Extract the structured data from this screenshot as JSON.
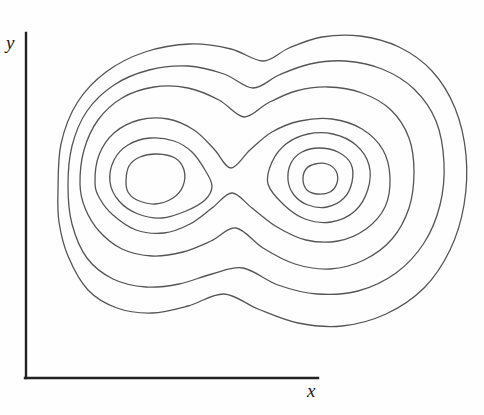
{
  "figure": {
    "kind": "contour-plot",
    "background_color": "#fefefe",
    "width": 484,
    "height": 415
  },
  "axes": {
    "x_label": "x",
    "y_label": "y",
    "axis_color": "#222222",
    "origin": {
      "x": 26,
      "y": 378
    },
    "x_axis_end": {
      "x": 318,
      "y": 378
    },
    "y_axis_end": {
      "x": 26,
      "y": 33
    },
    "ticks": [],
    "tick_labels": []
  },
  "chart_data": {
    "type": "line",
    "title": "",
    "subtitle": "",
    "xlabel": "x",
    "ylabel": "y",
    "grid": false,
    "legend": null,
    "legend_position": "none",
    "xlim": [
      0,
      484
    ],
    "ylim": [
      0,
      415
    ],
    "line_color": "#555555",
    "line_width": 1.3,
    "fill": "none",
    "maxima": [
      {
        "name": "left-peak",
        "x": 155,
        "y": 181
      },
      {
        "name": "right-peak",
        "x": 320,
        "y": 180
      }
    ],
    "saddle": {
      "name": "saddle-point",
      "x": 231,
      "y": 193
    },
    "contour_count": 9,
    "series": [
      {
        "name": "contour-level-1-left-inner",
        "closed": true,
        "level": 9,
        "points": [
          [
            126,
            181
          ],
          [
            129,
            166
          ],
          [
            140,
            157
          ],
          [
            157,
            154
          ],
          [
            175,
            158
          ],
          [
            184,
            170
          ],
          [
            183,
            186
          ],
          [
            173,
            198
          ],
          [
            155,
            204
          ],
          [
            137,
            200
          ],
          [
            128,
            192
          ]
        ]
      },
      {
        "name": "contour-level-1-right-inner",
        "closed": true,
        "level": 9,
        "points": [
          [
            303,
            180
          ],
          [
            306,
            169
          ],
          [
            315,
            164
          ],
          [
            327,
            164
          ],
          [
            336,
            171
          ],
          [
            337,
            183
          ],
          [
            330,
            192
          ],
          [
            317,
            194
          ],
          [
            307,
            190
          ]
        ]
      },
      {
        "name": "contour-level-2-right",
        "closed": true,
        "level": 8,
        "points": [
          [
            288,
            180
          ],
          [
            291,
            163
          ],
          [
            302,
            152
          ],
          [
            319,
            148
          ],
          [
            338,
            152
          ],
          [
            351,
            164
          ],
          [
            352,
            182
          ],
          [
            344,
            198
          ],
          [
            327,
            207
          ],
          [
            308,
            205
          ],
          [
            294,
            195
          ]
        ]
      },
      {
        "name": "contour-level-3-left",
        "closed": true,
        "level": 7,
        "points": [
          [
            110,
            182
          ],
          [
            114,
            160
          ],
          [
            128,
            145
          ],
          [
            150,
            138
          ],
          [
            174,
            141
          ],
          [
            192,
            152
          ],
          [
            205,
            170
          ],
          [
            212,
            186
          ],
          [
            205,
            200
          ],
          [
            186,
            211
          ],
          [
            162,
            218
          ],
          [
            138,
            214
          ],
          [
            119,
            201
          ]
        ]
      },
      {
        "name": "contour-level-3-right",
        "closed": true,
        "level": 7,
        "points": [
          [
            268,
            184
          ],
          [
            272,
            162
          ],
          [
            286,
            144
          ],
          [
            308,
            134
          ],
          [
            333,
            134
          ],
          [
            356,
            145
          ],
          [
            369,
            165
          ],
          [
            368,
            189
          ],
          [
            355,
            211
          ],
          [
            331,
            222
          ],
          [
            305,
            219
          ],
          [
            284,
            205
          ]
        ]
      },
      {
        "name": "contour-level-4-figure-eight",
        "closed": true,
        "level": 6,
        "points": [
          [
            95,
            183
          ],
          [
            99,
            155
          ],
          [
            114,
            133
          ],
          [
            139,
            120
          ],
          [
            168,
            119
          ],
          [
            194,
            130
          ],
          [
            214,
            149
          ],
          [
            231,
            168
          ],
          [
            250,
            150
          ],
          [
            272,
            132
          ],
          [
            300,
            121
          ],
          [
            332,
            119
          ],
          [
            362,
            129
          ],
          [
            383,
            150
          ],
          [
            390,
            178
          ],
          [
            385,
            207
          ],
          [
            366,
            229
          ],
          [
            338,
            241
          ],
          [
            306,
            240
          ],
          [
            277,
            227
          ],
          [
            252,
            208
          ],
          [
            232,
            193
          ],
          [
            212,
            208
          ],
          [
            190,
            224
          ],
          [
            164,
            233
          ],
          [
            136,
            230
          ],
          [
            113,
            215
          ],
          [
            100,
            199
          ]
        ]
      },
      {
        "name": "contour-level-5-outer-pinched",
        "closed": true,
        "level": 5,
        "points": [
          [
            80,
            184
          ],
          [
            84,
            150
          ],
          [
            98,
            120
          ],
          [
            122,
            98
          ],
          [
            154,
            87
          ],
          [
            188,
            88
          ],
          [
            219,
            100
          ],
          [
            244,
            117
          ],
          [
            268,
            103
          ],
          [
            296,
            91
          ],
          [
            328,
            87
          ],
          [
            362,
            93
          ],
          [
            391,
            110
          ],
          [
            409,
            138
          ],
          [
            414,
            172
          ],
          [
            409,
            208
          ],
          [
            392,
            239
          ],
          [
            364,
            260
          ],
          [
            330,
            269
          ],
          [
            295,
            264
          ],
          [
            263,
            248
          ],
          [
            236,
            228
          ],
          [
            211,
            241
          ],
          [
            183,
            252
          ],
          [
            152,
            256
          ],
          [
            122,
            249
          ],
          [
            99,
            231
          ],
          [
            85,
            208
          ]
        ]
      },
      {
        "name": "contour-level-6-outer",
        "closed": true,
        "level": 4,
        "points": [
          [
            68,
            186
          ],
          [
            72,
            146
          ],
          [
            87,
            111
          ],
          [
            114,
            85
          ],
          [
            149,
            70
          ],
          [
            188,
            66
          ],
          [
            224,
            74
          ],
          [
            253,
            88
          ],
          [
            279,
            75
          ],
          [
            310,
            64
          ],
          [
            345,
            61
          ],
          [
            382,
            69
          ],
          [
            414,
            89
          ],
          [
            436,
            121
          ],
          [
            444,
            163
          ],
          [
            440,
            205
          ],
          [
            424,
            243
          ],
          [
            396,
            273
          ],
          [
            358,
            291
          ],
          [
            317,
            294
          ],
          [
            278,
            285
          ],
          [
            243,
            268
          ],
          [
            212,
            274
          ],
          [
            179,
            284
          ],
          [
            146,
            287
          ],
          [
            113,
            279
          ],
          [
            87,
            258
          ],
          [
            72,
            224
          ]
        ]
      },
      {
        "name": "contour-level-7-outermost",
        "closed": true,
        "level": 3,
        "points": [
          [
            58,
            190
          ],
          [
            61,
            144
          ],
          [
            77,
            103
          ],
          [
            106,
            72
          ],
          [
            145,
            52
          ],
          [
            190,
            44
          ],
          [
            231,
            49
          ],
          [
            263,
            61
          ],
          [
            289,
            48
          ],
          [
            322,
            37
          ],
          [
            360,
            36
          ],
          [
            399,
            47
          ],
          [
            432,
            71
          ],
          [
            455,
            108
          ],
          [
            466,
            155
          ],
          [
            464,
            205
          ],
          [
            450,
            250
          ],
          [
            424,
            288
          ],
          [
            386,
            314
          ],
          [
            342,
            326
          ],
          [
            298,
            323
          ],
          [
            258,
            309
          ],
          [
            224,
            294
          ],
          [
            188,
            306
          ],
          [
            152,
            313
          ],
          [
            117,
            308
          ],
          [
            88,
            290
          ],
          [
            68,
            256
          ],
          [
            59,
            222
          ]
        ]
      }
    ]
  }
}
